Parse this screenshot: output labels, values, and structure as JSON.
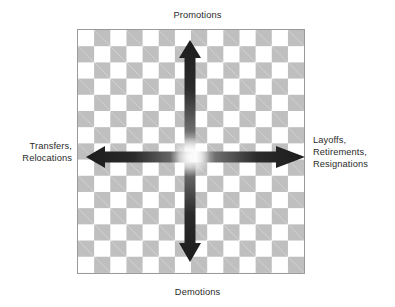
{
  "diagram": {
    "title_text": "Employee movement directions diagram",
    "board": {
      "name": "checkerboard-grid",
      "checker_color": "#bfbfbf",
      "background_color": "#ffffff",
      "border_color": "#9a9a9a",
      "columns": 14,
      "rows": 15
    },
    "arrow_color_dark": "#222222",
    "arrow_color_fade": "#f2f2f2",
    "labels": {
      "top": "Promotions",
      "bottom": "Demotions",
      "left": "Transfers,\nRelocations",
      "right": "Layoffs,\nRetirements,\nResignations"
    },
    "arrows": [
      {
        "name": "arrow-up",
        "direction": "up",
        "points_to": "Promotions"
      },
      {
        "name": "arrow-down",
        "direction": "down",
        "points_to": "Demotions"
      },
      {
        "name": "arrow-left",
        "direction": "left",
        "points_to": "Transfers, Relocations"
      },
      {
        "name": "arrow-right",
        "direction": "right",
        "points_to": "Layoffs, Retirements, Resignations"
      }
    ]
  }
}
